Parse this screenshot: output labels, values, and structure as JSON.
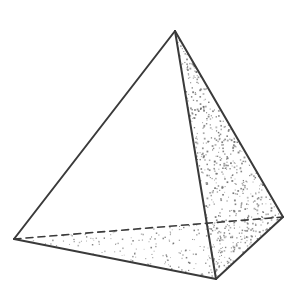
{
  "figure": {
    "name": "triangular-pyramid-tetrahedron",
    "kind": "line-drawing",
    "canvas": {
      "width": 306,
      "height": 300,
      "background": "#ffffff"
    },
    "style": {
      "stroke_color": "#3a3a3a",
      "stroke_width": 2,
      "hidden_edge_dash": "7,5",
      "stipple_color": "#6b6b6b",
      "face_fill": "#ffffff"
    },
    "vertices": [
      {
        "id": "apex",
        "label": "apex",
        "x": 175,
        "y": 31
      },
      {
        "id": "left",
        "label": "left-base-corner",
        "x": 14,
        "y": 239
      },
      {
        "id": "front",
        "label": "front-base-corner",
        "x": 216,
        "y": 279
      },
      {
        "id": "right",
        "label": "right-base-corner",
        "x": 283,
        "y": 217
      }
    ],
    "edges": [
      {
        "id": "apex-left",
        "from": "apex",
        "to": "left",
        "visibility": "visible"
      },
      {
        "id": "apex-front",
        "from": "apex",
        "to": "front",
        "visibility": "visible"
      },
      {
        "id": "apex-right",
        "from": "apex",
        "to": "right",
        "visibility": "visible"
      },
      {
        "id": "left-front",
        "from": "left",
        "to": "front",
        "visibility": "visible"
      },
      {
        "id": "front-right",
        "from": "front",
        "to": "right",
        "visibility": "visible"
      },
      {
        "id": "left-right",
        "from": "left",
        "to": "right",
        "visibility": "hidden"
      }
    ],
    "faces": [
      {
        "id": "left-face",
        "label": "left-front-face",
        "vertices": [
          "apex",
          "left",
          "front"
        ],
        "shading": "none"
      },
      {
        "id": "right-face",
        "label": "right-front-face",
        "vertices": [
          "apex",
          "front",
          "right"
        ],
        "shading": "dense-stipple"
      },
      {
        "id": "bottom-face",
        "label": "base-face",
        "vertices": [
          "left",
          "front",
          "right"
        ],
        "shading": "sparse-stipple"
      }
    ]
  }
}
